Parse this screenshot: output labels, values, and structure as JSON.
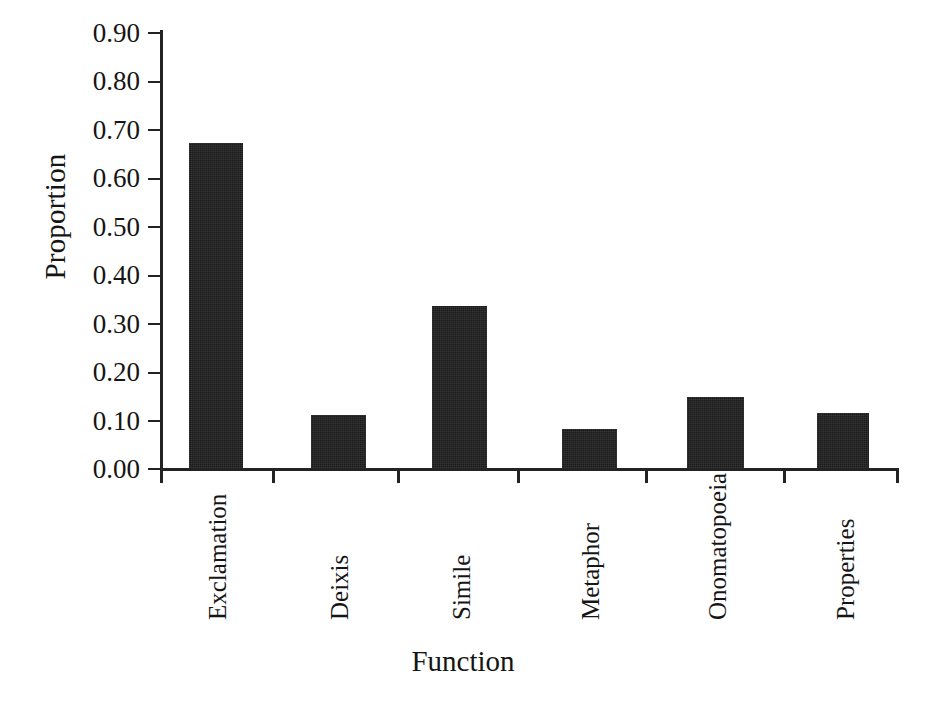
{
  "chart_data": {
    "type": "bar",
    "title": "",
    "subtitle": "",
    "xlabel": "Function",
    "ylabel": "Proportion",
    "categories": [
      "Exclamation",
      "Deixis",
      "Simile",
      "Metaphor",
      "Onomatopoeia",
      "Properties"
    ],
    "values": [
      0.67,
      0.11,
      0.335,
      0.08,
      0.147,
      0.114
    ],
    "series": [
      {
        "name": "Proportion",
        "values": [
          0.67,
          0.11,
          0.335,
          0.08,
          0.147,
          0.114
        ]
      }
    ],
    "ylim": [
      0.0,
      0.9
    ],
    "ytick_labels": [
      "0.90",
      "0.80",
      "0.70",
      "0.60",
      "0.50",
      "0.40",
      "0.30",
      "0.20",
      "0.10",
      "0.00"
    ],
    "ytick_values": [
      0.9,
      0.8,
      0.7,
      0.6,
      0.5,
      0.4,
      0.3,
      0.2,
      0.1,
      0.0
    ],
    "grid": false,
    "legend": false,
    "legend_position": "none",
    "bar_color": "#1b1b1b",
    "axis_color": "#232323",
    "background_color": "#ffffff",
    "annotations": []
  },
  "axes": {
    "y_title": "Proportion",
    "x_title": "Function"
  }
}
